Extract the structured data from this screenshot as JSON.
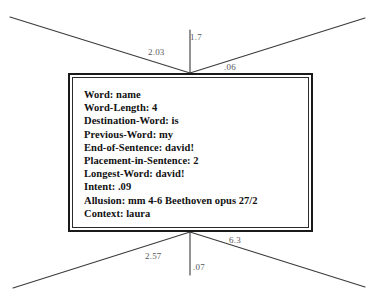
{
  "diagram": {
    "type": "node-with-weighted-edges",
    "background_color": "#ffffff",
    "edge_color": "#3a3a3f",
    "label_color": "#57575c",
    "node_border_color": "#1a1a1a",
    "node": {
      "title": "attribute-node",
      "attributes": [
        {
          "key": "Word",
          "value": "name",
          "text": "Word: name"
        },
        {
          "key": "Word-Length",
          "value": "4",
          "text": "Word-Length: 4"
        },
        {
          "key": "Destination-Word",
          "value": "is",
          "text": "Destination-Word: is"
        },
        {
          "key": "Previous-Word",
          "value": "my",
          "text": "Previous-Word: my"
        },
        {
          "key": "End-of-Sentence",
          "value": "david!",
          "text": "End-of-Sentence: david!"
        },
        {
          "key": "Placement-in-Sentence",
          "value": "2",
          "text": "Placement-in-Sentence: 2"
        },
        {
          "key": "Longest-Word",
          "value": "david!",
          "text": "Longest-Word: david!"
        },
        {
          "key": "Intent",
          "value": ".09",
          "text": "Intent: .09"
        },
        {
          "key": "Allusion",
          "value": "mm 4-6 Beethoven opus 27/2",
          "text": "Allusion: mm 4-6 Beethoven opus 27/2"
        },
        {
          "key": "Context",
          "value": "laura",
          "text": "Context: laura"
        }
      ]
    },
    "edges": [
      {
        "id": "top-left",
        "weight": "2.03",
        "label_x": 148,
        "label_y": 47
      },
      {
        "id": "top-center",
        "weight": "1.7",
        "label_x": 190,
        "label_y": 32
      },
      {
        "id": "top-right",
        "weight": ".06",
        "label_x": 224,
        "label_y": 62
      },
      {
        "id": "bottom-left",
        "weight": "2.57",
        "label_x": 145,
        "label_y": 251
      },
      {
        "id": "bottom-center",
        "weight": ".07",
        "label_x": 193,
        "label_y": 262
      },
      {
        "id": "bottom-right",
        "weight": "6.3",
        "label_x": 229,
        "label_y": 235
      }
    ]
  }
}
